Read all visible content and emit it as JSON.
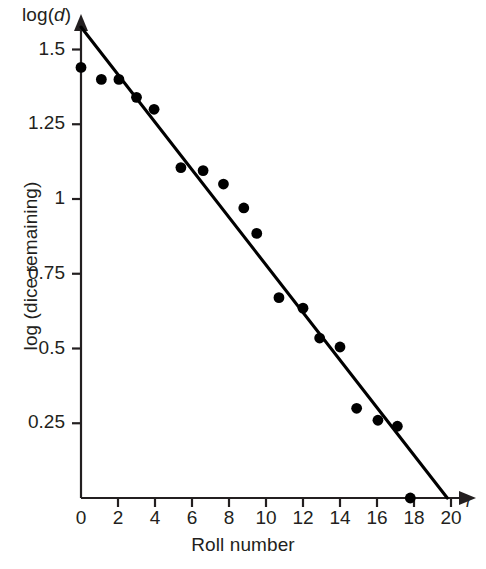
{
  "labels": {
    "y_axis_title": "log (dice remaining)",
    "x_axis_title": "Roll number",
    "y_axis_symbol_prefix": "log(",
    "y_axis_symbol_var": "d",
    "y_axis_symbol_suffix": ")",
    "x_axis_symbol": "r"
  },
  "chart_data": {
    "type": "scatter",
    "title": "",
    "xlabel": "Roll number",
    "ylabel": "log (dice remaining)",
    "xlim": [
      0,
      20.6
    ],
    "ylim": [
      0,
      1.6
    ],
    "grid": false,
    "legend": "none",
    "xticks": [
      0,
      2,
      4,
      6,
      8,
      10,
      12,
      14,
      16,
      18,
      20
    ],
    "xticklabels": [
      "0",
      "2",
      "4",
      "6",
      "8",
      "10",
      "12",
      "14",
      "16",
      "18",
      "20"
    ],
    "yticks": [
      0.25,
      0.5,
      0.75,
      1,
      1.25,
      1.5
    ],
    "yticklabels": [
      "0.25",
      "0.5",
      "0.75",
      "1",
      "1.25",
      "1.5"
    ],
    "marker_color": "#000000",
    "line_color": "#000000",
    "axis_color": "#231f20",
    "points": [
      {
        "x": 0.0,
        "y": 1.44
      },
      {
        "x": 1.1,
        "y": 1.4
      },
      {
        "x": 2.05,
        "y": 1.4
      },
      {
        "x": 3.0,
        "y": 1.34
      },
      {
        "x": 3.95,
        "y": 1.3
      },
      {
        "x": 5.4,
        "y": 1.105
      },
      {
        "x": 6.6,
        "y": 1.095
      },
      {
        "x": 7.7,
        "y": 1.05
      },
      {
        "x": 8.8,
        "y": 0.97
      },
      {
        "x": 9.5,
        "y": 0.885
      },
      {
        "x": 10.7,
        "y": 0.67
      },
      {
        "x": 12.0,
        "y": 0.635
      },
      {
        "x": 12.9,
        "y": 0.535
      },
      {
        "x": 14.0,
        "y": 0.505
      },
      {
        "x": 14.9,
        "y": 0.3
      },
      {
        "x": 16.05,
        "y": 0.26
      },
      {
        "x": 17.1,
        "y": 0.24
      },
      {
        "x": 17.8,
        "y": 0.0
      }
    ],
    "fit_line": {
      "type": "line",
      "x0": 0.0,
      "y0": 1.575,
      "x1": 19.8,
      "y1": 0.0
    }
  }
}
